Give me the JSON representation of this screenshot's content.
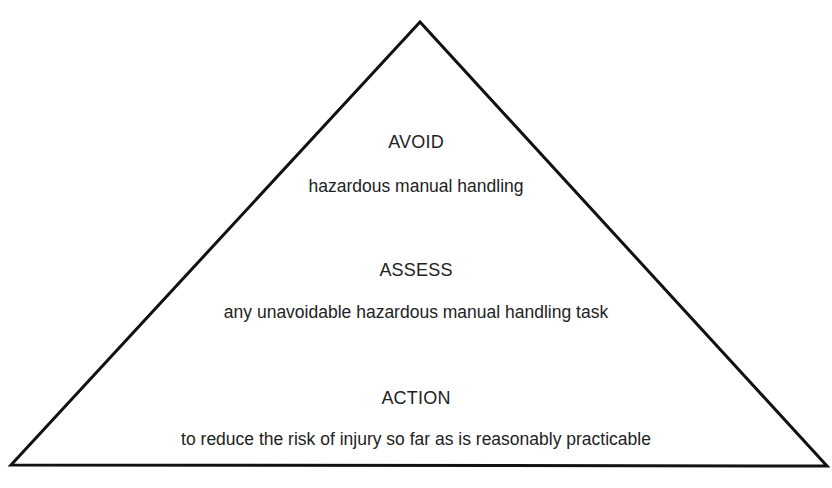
{
  "diagram": {
    "type": "pyramid",
    "stroke_color": "#111111",
    "text_color": "#222222",
    "background": "#ffffff",
    "tiers": [
      {
        "heading": "AVOID",
        "description": "hazardous manual handling"
      },
      {
        "heading": "ASSESS",
        "description": "any unavoidable hazardous manual handling task"
      },
      {
        "heading": "ACTION",
        "description": "to reduce the risk of injury so far as is reasonably practicable"
      }
    ]
  }
}
